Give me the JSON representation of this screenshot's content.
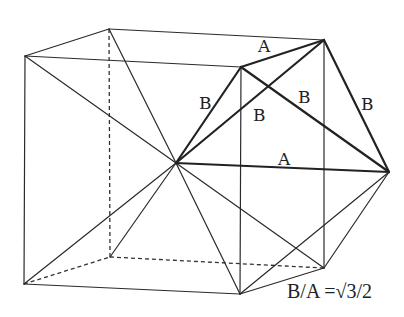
{
  "diagram": {
    "vertices": {
      "top_front_left": [
        25,
        56
      ],
      "top_back_left": [
        109,
        29
      ],
      "top_back_right": [
        324,
        40
      ],
      "top_front_right": [
        241,
        67
      ],
      "bottom_front_left": [
        24,
        284
      ],
      "bottom_back_left": [
        110,
        257
      ],
      "bottom_back_right": [
        324,
        268
      ],
      "bottom_front_right": [
        240,
        294
      ],
      "center": [
        176,
        163
      ],
      "apex_right": [
        389,
        172
      ]
    },
    "labels": {
      "a_top": "A",
      "a_mid": "A",
      "b_left": "B",
      "b_inner": "B",
      "b_cross": "B",
      "b_right": "B"
    },
    "caption": "B/A =√3/2"
  }
}
